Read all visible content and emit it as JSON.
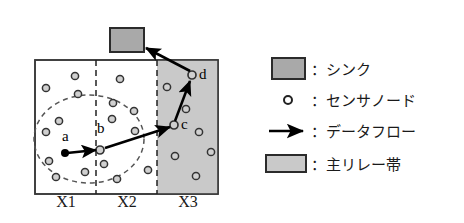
{
  "figure": {
    "title": "",
    "field": {
      "x": 35,
      "y": 60,
      "width": 183,
      "height": 134,
      "border_color": "#3a3a3a",
      "fill_color": "#ffffff"
    },
    "relay_band": {
      "x": 157,
      "y": 60,
      "width": 61,
      "height": 134,
      "fill_color": "#c9c9c9",
      "name": "main-relay-band"
    },
    "dividers": [
      {
        "x": 96,
        "label": "divider-x1-x2"
      },
      {
        "x": 157,
        "label": "divider-x2-x3"
      }
    ],
    "zone_labels": [
      {
        "text": "X1",
        "x": 66,
        "y": 207
      },
      {
        "text": "X2",
        "x": 127,
        "y": 207
      },
      {
        "text": "X3",
        "x": 188,
        "y": 207
      }
    ],
    "sink": {
      "x": 110,
      "y": 28,
      "width": 34,
      "height": 24,
      "fill_color": "#a9a9a9",
      "border_color": "#2b2b2b"
    },
    "coverage_ellipse": {
      "cx": 89,
      "cy": 139,
      "rx": 55,
      "ry": 44,
      "stroke_color": "#555555",
      "dash": "5 4"
    },
    "node_color": "#d0d0d0",
    "node_stroke": "#333333",
    "node_radius": 3.6,
    "source_node": {
      "cx": 65,
      "cy": 153,
      "r": 4,
      "fill": "#000000",
      "label": "a",
      "label_x": 62,
      "label_y": 141
    },
    "labeled_nodes": [
      {
        "id": "b",
        "cx": 100,
        "cy": 150,
        "label_x": 97,
        "label_y": 133
      },
      {
        "id": "c",
        "cx": 174,
        "cy": 125,
        "label_x": 181,
        "label_y": 129
      },
      {
        "id": "d",
        "cx": 192,
        "cy": 75,
        "label_x": 199,
        "label_y": 79
      }
    ],
    "nodes": [
      {
        "cx": 46,
        "cy": 88
      },
      {
        "cx": 75,
        "cy": 76
      },
      {
        "cx": 78,
        "cy": 94
      },
      {
        "cx": 59,
        "cy": 121
      },
      {
        "cx": 46,
        "cy": 132
      },
      {
        "cx": 49,
        "cy": 161
      },
      {
        "cx": 56,
        "cy": 177
      },
      {
        "cx": 85,
        "cy": 172
      },
      {
        "cx": 120,
        "cy": 79
      },
      {
        "cx": 113,
        "cy": 103
      },
      {
        "cx": 112,
        "cy": 119
      },
      {
        "cx": 134,
        "cy": 111
      },
      {
        "cx": 135,
        "cy": 131
      },
      {
        "cx": 104,
        "cy": 164
      },
      {
        "cx": 117,
        "cy": 179
      },
      {
        "cx": 148,
        "cy": 170
      },
      {
        "cx": 167,
        "cy": 87
      },
      {
        "cx": 186,
        "cy": 109
      },
      {
        "cx": 199,
        "cy": 132
      },
      {
        "cx": 175,
        "cy": 156
      },
      {
        "cx": 196,
        "cy": 176
      },
      {
        "cx": 211,
        "cy": 152
      }
    ],
    "arrows": [
      {
        "name": "flow-a-to-b",
        "x1": 67,
        "y1": 153,
        "x2": 96,
        "y2": 150
      },
      {
        "name": "flow-b-to-c",
        "x1": 105,
        "y1": 148,
        "x2": 170,
        "y2": 127
      },
      {
        "name": "flow-c-to-d",
        "x1": 175,
        "y1": 121,
        "x2": 190,
        "y2": 81
      },
      {
        "name": "flow-d-to-sink",
        "x1": 190,
        "y1": 71,
        "x2": 146,
        "y2": 48
      }
    ],
    "arrow_color": "#000000"
  },
  "legend": {
    "separator": "：",
    "items": [
      {
        "key": "sink",
        "marker": "filled-rect",
        "marker_color": "#a9a9a9",
        "label": "シンク",
        "icon_name": "sink-swatch"
      },
      {
        "key": "sensor-node",
        "marker": "small-circle",
        "marker_color": "#ffffff",
        "label": "センサノード",
        "icon_name": "sensor-node-swatch"
      },
      {
        "key": "data-flow",
        "marker": "arrow",
        "marker_color": "#000000",
        "label": "データフロー",
        "icon_name": "data-flow-arrow"
      },
      {
        "key": "main-relay-band",
        "marker": "filled-rect",
        "marker_color": "#c9c9c9",
        "label": "主リレー帯",
        "icon_name": "relay-band-swatch"
      }
    ]
  }
}
